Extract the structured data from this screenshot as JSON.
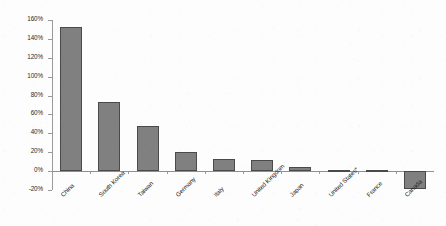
{
  "chart_data": {
    "type": "bar",
    "title": "",
    "subtitle": "",
    "xlabel": "",
    "ylabel": "",
    "categories": [
      "China",
      "South Korea",
      "Taiwan",
      "Germany",
      "Italy",
      "United Kingdom",
      "Japan",
      "United States*",
      "France",
      "Canada"
    ],
    "values": [
      153,
      73,
      48,
      20,
      13,
      12,
      4,
      1.5,
      1,
      -19
    ],
    "value_unit": "percent",
    "ylim": [
      -20,
      160
    ],
    "ytick_values": [
      -20,
      0,
      20,
      40,
      60,
      80,
      100,
      120,
      140,
      160
    ],
    "ytick_labels": [
      "-20%",
      "0%",
      "20%",
      "40%",
      "60%",
      "80%",
      "100%",
      "120%",
      "140%",
      "160%"
    ],
    "grid": false,
    "legend": null,
    "legend_position": "none",
    "bar_color": "#808080",
    "bar_border_color": "#4a4a4a",
    "axis_color": "#9a9a9a",
    "background_color": "#fdfdfd",
    "text_color": "#1f1f1f",
    "annotations": []
  }
}
